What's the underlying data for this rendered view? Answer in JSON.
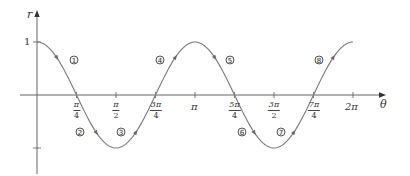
{
  "chart_data": {
    "type": "line",
    "title": "",
    "function": "r = cos(2θ)",
    "xlabel": "θ",
    "ylabel": "r",
    "xlim": [
      0,
      6.2832
    ],
    "ylim": [
      -1,
      1
    ],
    "grid": false,
    "x_tick_labels": [
      {
        "value": 0.7854,
        "num": "π",
        "den": "4"
      },
      {
        "value": 1.5708,
        "num": "π",
        "den": "2"
      },
      {
        "value": 2.3562,
        "num": "3π",
        "den": "4"
      },
      {
        "value": 3.1416,
        "label": "π"
      },
      {
        "value": 3.927,
        "num": "5π",
        "den": "4"
      },
      {
        "value": 4.7124,
        "num": "3π",
        "den": "2"
      },
      {
        "value": 5.4978,
        "num": "7π",
        "den": "4"
      },
      {
        "value": 6.2832,
        "label": "2π"
      }
    ],
    "y_tick_labels": [
      {
        "value": 1,
        "label": "1"
      },
      {
        "value": -1,
        "label": ""
      }
    ],
    "series": [
      {
        "name": "r = cos 2θ",
        "x": [
          0,
          0.3927,
          0.7854,
          1.1781,
          1.5708,
          1.9635,
          2.3562,
          2.7489,
          3.1416,
          3.5343,
          3.927,
          4.3197,
          4.7124,
          5.1051,
          5.4978,
          5.8905,
          6.2832
        ],
        "values": [
          1,
          0.707,
          0,
          -0.707,
          -1,
          -0.707,
          0,
          0.707,
          1,
          0.707,
          0,
          -0.707,
          -1,
          -0.707,
          0,
          0.707,
          1
        ]
      }
    ],
    "annotations": [
      {
        "label": "①",
        "theta": 0.39,
        "r": 0.66
      },
      {
        "label": "②",
        "theta": 0.83,
        "r": -0.7
      },
      {
        "label": "③",
        "theta": 1.66,
        "r": -0.7
      },
      {
        "label": "④",
        "theta": 2.45,
        "r": 0.66
      },
      {
        "label": "⑤",
        "theta": 3.84,
        "r": 0.66
      },
      {
        "label": "⑥",
        "theta": 4.07,
        "r": -0.7
      },
      {
        "label": "⑦",
        "theta": 4.85,
        "r": -0.7
      },
      {
        "label": "⑧",
        "theta": 5.6,
        "r": 0.66
      }
    ]
  },
  "labels": {
    "r_axis": "r",
    "theta_axis": "θ",
    "one": "1",
    "pi": "π",
    "two_pi": "2π",
    "ticks": [
      {
        "num": "π",
        "den": "4"
      },
      {
        "num": "π",
        "den": "2"
      },
      {
        "num": "3π",
        "den": "4"
      },
      {
        "num": "5π",
        "den": "4"
      },
      {
        "num": "3π",
        "den": "2"
      },
      {
        "num": "7π",
        "den": "4"
      }
    ],
    "circled": [
      "1",
      "2",
      "3",
      "4",
      "5",
      "6",
      "7",
      "8"
    ]
  }
}
